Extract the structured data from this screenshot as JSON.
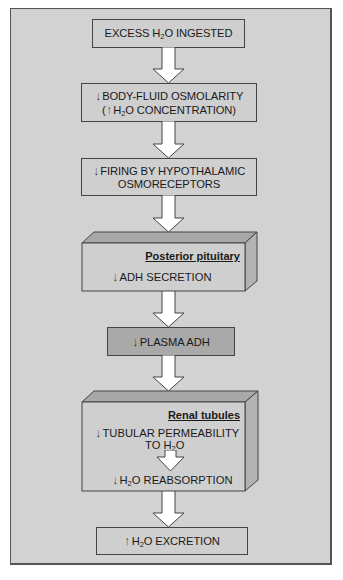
{
  "diagram": {
    "colors": {
      "background": "#d2d2d2",
      "box_fill": "#cfcfcf",
      "box_dark_fill": "#a9a9a9",
      "box_3d_top": "#a8a8a8",
      "box_3d_side": "#b3b3b3",
      "arrow_fill": "#ffffff",
      "border": "#444444"
    },
    "nodes": [
      {
        "id": "excess-water",
        "lines": [
          {
            "prefix": "EXCESS H",
            "sub": "2",
            "suffix": "O INGESTED"
          }
        ]
      },
      {
        "id": "osmolarity",
        "lines": [
          {
            "arrow": "↓",
            "prefix": "BODY-FLUID OSMOLARITY",
            "sub": "",
            "suffix": ""
          },
          {
            "paren_open": "(",
            "arrow": "↑",
            "prefix": "H",
            "sub": "2",
            "suffix": "O CONCENTRATION)"
          }
        ]
      },
      {
        "id": "osmoreceptors",
        "lines": [
          {
            "arrow": "↓",
            "prefix": "FIRING BY HYPOTHALAMIC"
          },
          {
            "prefix": "OSMORECEPTORS"
          }
        ]
      },
      {
        "id": "posterior-pituitary",
        "region_label": "Posterior pituitary",
        "lines": [
          {
            "arrow": "↓",
            "prefix": "ADH SECRETION"
          }
        ]
      },
      {
        "id": "plasma-adh",
        "lines": [
          {
            "arrow": "↓",
            "prefix": "PLASMA ADH"
          }
        ]
      },
      {
        "id": "renal-tubules",
        "region_label": "Renal tubules",
        "lines": [
          {
            "arrow": "↓",
            "prefix": "TUBULAR PERMEABILITY"
          },
          {
            "prefix": "TO H",
            "sub": "2",
            "suffix": "O"
          },
          {
            "arrow": "↓",
            "prefix": "H",
            "sub": "2",
            "suffix": "O REABSORPTION"
          }
        ]
      },
      {
        "id": "water-excretion",
        "lines": [
          {
            "arrow": "↑",
            "prefix": "H",
            "sub": "2",
            "suffix": "O EXCRETION"
          }
        ]
      }
    ]
  }
}
